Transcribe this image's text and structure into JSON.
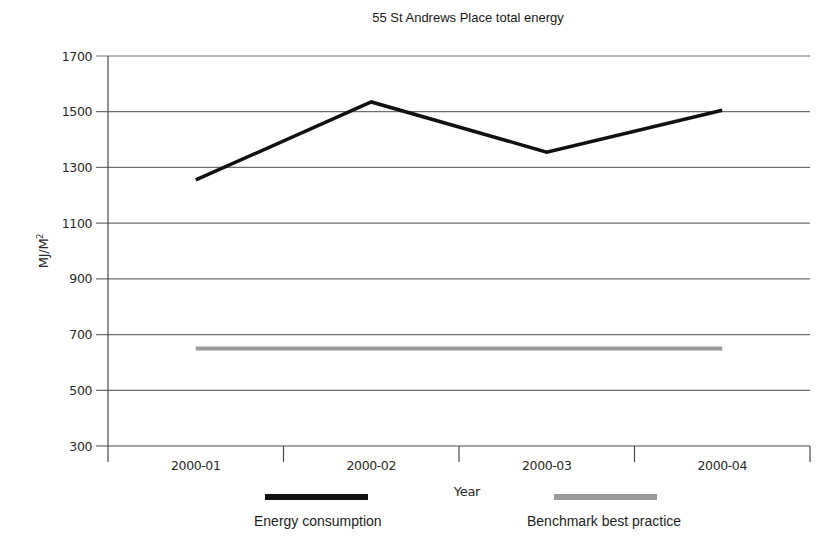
{
  "chart_data": {
    "type": "line",
    "title": "55 St Andrews Place total energy",
    "xlabel": "Year",
    "ylabel": "MJ/M²",
    "categories": [
      "2000-01",
      "2000-02",
      "2000-03",
      "2000-04"
    ],
    "series": [
      {
        "name": "Energy consumption",
        "color": "#111111",
        "values": [
          1255,
          1535,
          1355,
          1505
        ]
      },
      {
        "name": "Benchmark best practice",
        "color": "#9a9a9a",
        "values": [
          650,
          650,
          650,
          650
        ]
      }
    ],
    "ylim": [
      300,
      1700
    ],
    "yticks": [
      300,
      500,
      700,
      900,
      1100,
      1300,
      1500,
      1700
    ],
    "grid": true,
    "legend_position": "bottom"
  },
  "labels": {
    "title": "55 St Andrews Place total energy",
    "ylabel_main": "MJ/M",
    "ylabel_sup": "2",
    "xlabel": "Year",
    "legend": [
      {
        "label": "Energy consumption",
        "color": "#111111"
      },
      {
        "label": "Benchmark best practice",
        "color": "#9a9a9a"
      }
    ]
  }
}
